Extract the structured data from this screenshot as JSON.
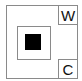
{
  "diagram": {
    "corner_labels": {
      "top_right": "W",
      "bottom_right": "C"
    },
    "colors": {
      "border": "#8a8a8a",
      "core": "#000000",
      "background": "#ffffff"
    }
  }
}
